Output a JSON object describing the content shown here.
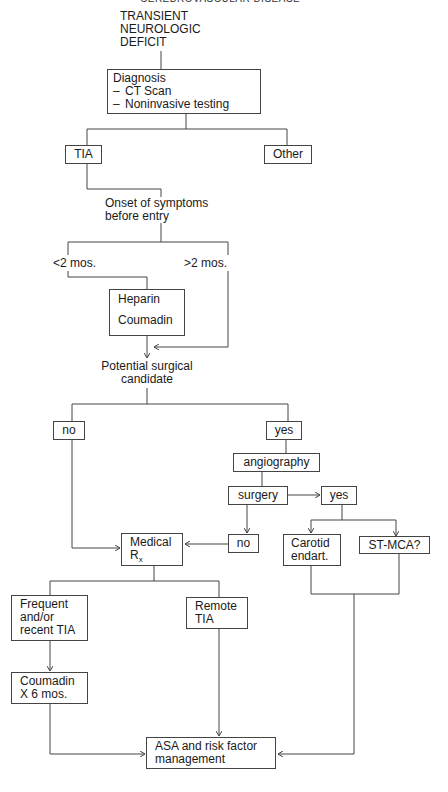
{
  "header": {
    "running_head": "CEREBROVASCULAR DISEASE"
  },
  "diagram": {
    "title": [
      "TRANSIENT",
      "NEUROLOGIC",
      "DEFICIT"
    ],
    "diagnosis": {
      "heading": "Diagnosis",
      "items": [
        "CT Scan",
        "Noninvasive testing"
      ]
    },
    "branches_diagnosis": {
      "left": "TIA",
      "right": "Other"
    },
    "onset": [
      "Onset of symptoms",
      "before entry"
    ],
    "onset_branches": {
      "left": "<2 mos.",
      "right": ">2 mos."
    },
    "anticoag": {
      "first": "Heparin",
      "second": "Coumadin"
    },
    "surgical_candidate": [
      "Potential surgical",
      "candidate"
    ],
    "candidate_branches": {
      "no": "no",
      "yes": "yes"
    },
    "angiography": "angiography",
    "surgery": "surgery",
    "surgery_yes": "yes",
    "surgery_no": "no",
    "surgical_options": {
      "carotid": [
        "Carotid",
        "endart."
      ],
      "stmca": "ST-MCA?"
    },
    "medical_rx": {
      "main": "Medical",
      "r": "R",
      "sub": "x"
    },
    "tia_types": {
      "frequent": [
        "Frequent",
        "and/or",
        "recent TIA"
      ],
      "remote": [
        "Remote",
        "TIA"
      ]
    },
    "coumadin_course": [
      "Coumadin",
      "X 6 mos."
    ],
    "final": [
      "ASA and risk factor",
      "management"
    ]
  },
  "styles": {
    "line_color": "#444444",
    "text_color": "#1a1a1a",
    "background": "#ffffff"
  }
}
